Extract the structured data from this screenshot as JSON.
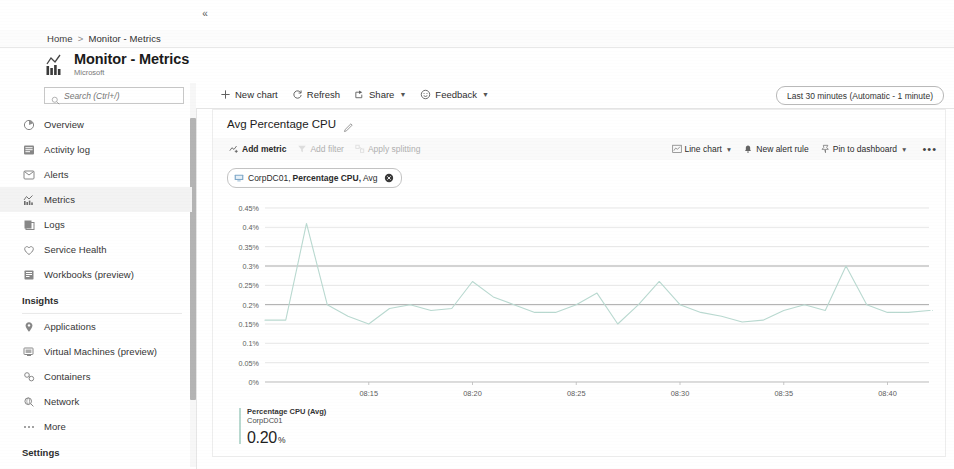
{
  "breadcrumb": {
    "home": "Home",
    "separator": ">",
    "current": "Monitor - Metrics"
  },
  "header": {
    "title": "Monitor - Metrics",
    "subtitle": "Microsoft",
    "icon": "metrics-chart-icon"
  },
  "sidebar": {
    "search": {
      "placeholder": "Search (Ctrl+/)",
      "value": ""
    },
    "collapse_label": "«",
    "items": [
      {
        "label": "Overview",
        "icon": "overview-icon",
        "active": false
      },
      {
        "label": "Activity log",
        "icon": "activity-log-icon",
        "active": false
      },
      {
        "label": "Alerts",
        "icon": "alerts-icon",
        "active": false
      },
      {
        "label": "Metrics",
        "icon": "metrics-icon",
        "active": true
      },
      {
        "label": "Logs",
        "icon": "logs-icon",
        "active": false
      },
      {
        "label": "Service Health",
        "icon": "service-health-icon",
        "active": false
      },
      {
        "label": "Workbooks (preview)",
        "icon": "workbooks-icon",
        "active": false
      }
    ],
    "insights_section": "Insights",
    "insights_items": [
      {
        "label": "Applications",
        "icon": "applications-icon"
      },
      {
        "label": "Virtual Machines (preview)",
        "icon": "virtual-machines-icon"
      },
      {
        "label": "Containers",
        "icon": "containers-icon"
      },
      {
        "label": "Network",
        "icon": "network-icon"
      },
      {
        "label": "More",
        "icon": "more-icon"
      }
    ],
    "settings_section": "Settings"
  },
  "command_bar": {
    "new_chart": "New chart",
    "refresh": "Refresh",
    "share": "Share",
    "feedback": "Feedback",
    "time_range": "Last 30 minutes (Automatic - 1 minute)"
  },
  "chart_card": {
    "title": "Avg Percentage CPU",
    "edit_icon": "pencil-icon",
    "toolbar": {
      "add_metric": "Add metric",
      "add_filter": "Add filter",
      "apply_splitting": "Apply splitting",
      "chart_type": "Line chart",
      "new_alert_rule": "New alert rule",
      "pin_to_dashboard": "Pin to dashboard",
      "more": "•••"
    },
    "metric_chip": {
      "resource": "CorpDC01,",
      "metric": "Percentage CPU,",
      "aggregation": "Avg",
      "close_label": "×"
    },
    "legend": {
      "series_name": "Percentage CPU (Avg)",
      "resource": "CorpDC01",
      "value": "0.20",
      "unit": "%",
      "color": "#b9d9d0"
    }
  },
  "chart_data": {
    "type": "line",
    "title": "Avg Percentage CPU",
    "xlabel": "",
    "ylabel": "",
    "ylim": [
      0,
      0.45
    ],
    "grid": true,
    "legend_position": "bottom-left",
    "ytick_labels": [
      "0.45%",
      "0.4%",
      "0.35%",
      "0.3%",
      "0.25%",
      "0.2%",
      "0.15%",
      "0.1%",
      "0.05%",
      "0%"
    ],
    "ytick_values": [
      0.45,
      0.4,
      0.35,
      0.3,
      0.25,
      0.2,
      0.15,
      0.1,
      0.05,
      0
    ],
    "xtick_labels": [
      "08:15",
      "08:20",
      "08:25",
      "08:30",
      "08:35",
      "08:40"
    ],
    "xtick_positions": [
      5,
      10,
      15,
      20,
      25,
      30
    ],
    "xlim": [
      0,
      32
    ],
    "series": [
      {
        "name": "Percentage CPU (Avg) CorpDC01",
        "color": "#b9d9d0",
        "x": [
          0,
          1,
          2,
          3,
          4,
          5,
          6,
          7,
          8,
          9,
          10,
          11,
          12,
          13,
          14,
          15,
          16,
          17,
          18,
          19,
          20,
          21,
          22,
          23,
          24,
          25,
          26,
          27,
          28,
          29,
          30,
          31,
          32
        ],
        "values": [
          0.16,
          0.16,
          0.41,
          0.2,
          0.17,
          0.15,
          0.19,
          0.2,
          0.185,
          0.19,
          0.26,
          0.22,
          0.2,
          0.18,
          0.18,
          0.2,
          0.23,
          0.15,
          0.2,
          0.26,
          0.2,
          0.18,
          0.17,
          0.155,
          0.16,
          0.185,
          0.2,
          0.185,
          0.3,
          0.2,
          0.18,
          0.18,
          0.185
        ]
      }
    ]
  }
}
